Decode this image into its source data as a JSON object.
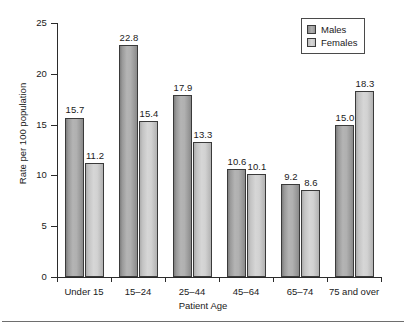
{
  "chart_data": {
    "type": "bar",
    "title": "",
    "xlabel": "Patient Age",
    "ylabel": "Rate per 100 population",
    "categories": [
      "Under 15",
      "15–24",
      "25–44",
      "45–64",
      "65–74",
      "75 and over"
    ],
    "series": [
      {
        "name": "Males",
        "color": "#a8a8a8",
        "values": [
          15.7,
          22.8,
          17.9,
          10.6,
          9.2,
          15.0
        ]
      },
      {
        "name": "Females",
        "color": "#d0d0d0",
        "values": [
          11.2,
          15.4,
          13.3,
          10.1,
          8.6,
          18.3
        ]
      }
    ],
    "ylim": [
      0,
      25
    ],
    "yticks": [
      0,
      5,
      10,
      15,
      20,
      25
    ],
    "ytick_labels": [
      "0",
      "5",
      "10",
      "15",
      "20",
      "25"
    ],
    "grid": false,
    "legend_position": "top-right",
    "value_labels": [
      "15.7",
      "11.2",
      "22.8",
      "15.4",
      "17.9",
      "13.3",
      "10.6",
      "10.1",
      "9.2",
      "8.6",
      "15.0",
      "18.3"
    ]
  },
  "legend": {
    "items": [
      {
        "label": "Males"
      },
      {
        "label": "Females"
      }
    ]
  }
}
